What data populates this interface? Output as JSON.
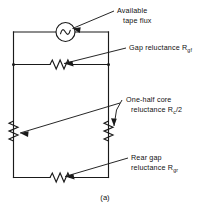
{
  "figure": {
    "caption": "(a)",
    "type": "magnetic-reluctance-equivalent-circuit"
  },
  "labels": {
    "source": {
      "line1": "Available",
      "line2": "tape flux"
    },
    "front_gap": {
      "line1_pre": "Gap reluctance R",
      "line1_sub": "gf"
    },
    "core": {
      "line1": "One-half core",
      "line2_pre": "reluctance R",
      "line2_sub": "c",
      "line2_post": "/2"
    },
    "rear_gap": {
      "line1": "Rear gap",
      "line2_pre": "reluctance R",
      "line2_sub": "gr"
    }
  },
  "components": {
    "source_name": "ac-flux-source",
    "source_symbol": "sine-wave",
    "front_gap_name": "gap-reluctance-resistor",
    "core_left_name": "half-core-reluctance-resistor-left",
    "core_right_name": "half-core-reluctance-resistor-right",
    "rear_gap_name": "rear-gap-reluctance-resistor"
  },
  "colors": {
    "line": "#1a1a1a",
    "background": "#ffffff"
  }
}
